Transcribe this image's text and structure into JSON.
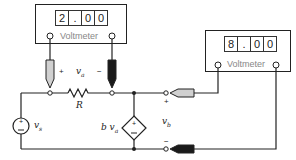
{
  "meters": [
    {
      "name": "voltmeter-a",
      "digits": [
        "2",
        ".",
        "0",
        "0"
      ],
      "label": "Voltmeter",
      "reading": "2.00"
    },
    {
      "name": "voltmeter-b",
      "digits": [
        "8",
        ".",
        "0",
        "0"
      ],
      "label": "Voltmeter",
      "reading": "8.00"
    }
  ],
  "labels": {
    "va": "v",
    "va_sub": "a",
    "R": "R",
    "vs": "v",
    "vs_sub": "s",
    "bva_b": "b v",
    "bva_sub": "a",
    "vb": "v",
    "vb_sub": "b",
    "plus": "+",
    "minus": "−"
  },
  "colors": {
    "wire": "#222222",
    "probe_positive": "#d0d0d0",
    "probe_negative": "#1a1a1a",
    "meter_label": "#888888"
  }
}
